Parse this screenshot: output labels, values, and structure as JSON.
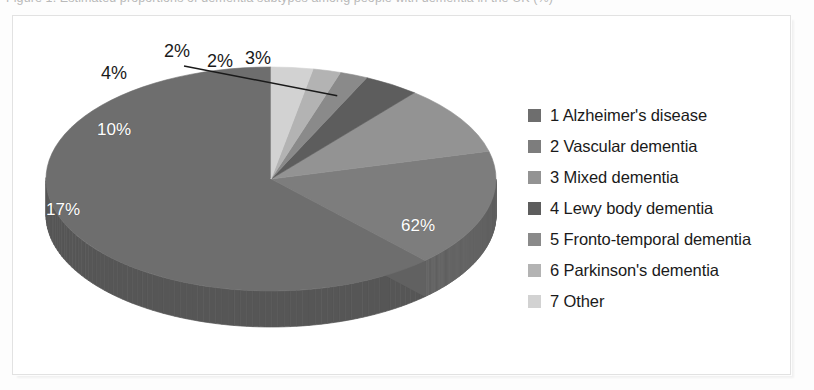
{
  "caption": {
    "text": "Figure 1. Estimated proportions of dementia subtypes among people with dementia in the UK (%)"
  },
  "legend": {
    "items": [
      {
        "label": "1 Alzheimer's disease",
        "color": "#6e6e6e"
      },
      {
        "label": "2 Vascular dementia",
        "color": "#7d7d7d"
      },
      {
        "label": "3 Mixed dementia",
        "color": "#939393"
      },
      {
        "label": "4 Lewy body dementia",
        "color": "#5d5d5d"
      },
      {
        "label": "5 Fronto-temporal dementia",
        "color": "#8a8a8a"
      },
      {
        "label": "6 Parkinson's dementia",
        "color": "#b3b3b3"
      },
      {
        "label": "7 Other",
        "color": "#d2d2d2"
      }
    ]
  },
  "chart_data": {
    "type": "pie",
    "title": "",
    "threeD": true,
    "legend_position": "right",
    "value_format": "percent",
    "labels": [
      "1 Alzheimer's disease",
      "2 Vascular dementia",
      "3 Mixed dementia",
      "4 Lewy body dementia",
      "5 Fronto-temporal dementia",
      "6 Parkinson's dementia",
      "7 Other"
    ],
    "values": [
      62,
      17,
      10,
      4,
      2,
      2,
      3
    ],
    "value_labels": [
      "62%",
      "17%",
      "10%",
      "4%",
      "2%",
      "2%",
      "3%"
    ],
    "colors": [
      "#6e6e6e",
      "#7d7d7d",
      "#939393",
      "#5d5d5d",
      "#8a8a8a",
      "#b3b3b3",
      "#d2d2d2"
    ],
    "side_colors": [
      "#565656",
      "#616161",
      "#717171",
      "#484848",
      "#6a6a6a",
      "#8c8c8c",
      "#a5a5a5"
    ],
    "label_placement": [
      "inside",
      "inside",
      "inside",
      "outside",
      "outside-leader",
      "outside",
      "outside"
    ]
  },
  "pie_labels": {
    "p62": "62%",
    "p17": "17%",
    "p10": "10%",
    "p4": "4%",
    "p2a": "2%",
    "p2b": "2%",
    "p3": "3%"
  }
}
